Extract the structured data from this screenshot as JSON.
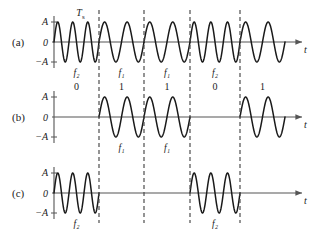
{
  "figure": {
    "title": "",
    "rows": [
      {
        "id": "a",
        "label": "(a)",
        "axis": {
          "top": "A",
          "mid": "0",
          "bottom": "−A",
          "x_axis": "t"
        },
        "annotation": "T",
        "annotation_sub": "s",
        "segment_labels": [
          "f₂",
          "f₁",
          "f₁",
          "f₂",
          ""
        ],
        "bit_labels": [
          "0",
          "1",
          "1",
          "0",
          "1"
        ]
      },
      {
        "id": "b",
        "label": "(b)",
        "axis": {
          "top": "A",
          "mid": "0",
          "bottom": "−A",
          "x_axis": "t"
        },
        "annotation": "",
        "annotation_sub": "",
        "segment_labels": [
          "",
          "f₁",
          "f₁",
          "",
          ""
        ],
        "bit_labels": []
      },
      {
        "id": "c",
        "label": "(c)",
        "axis": {
          "top": "A",
          "mid": "0",
          "bottom": "−A",
          "x_axis": "t"
        },
        "annotation": "",
        "annotation_sub": "",
        "segment_labels": [
          "f₂",
          "",
          "",
          "f₂",
          ""
        ],
        "bit_labels": []
      }
    ]
  },
  "chart_data": {
    "type": "line",
    "xlabel": "t",
    "ylabel": "A",
    "ylim": [
      -1,
      1
    ],
    "grid": false,
    "legend": "none",
    "bit_period_label": "T_s",
    "bits": [
      "0",
      "1",
      "1",
      "0",
      "1"
    ],
    "frequencies": {
      "f1": {
        "label": "f₁",
        "cycles_per_bit": 2
      },
      "f2": {
        "label": "f₂",
        "cycles_per_bit": 3
      }
    },
    "segment_boundaries_px": [
      54,
      99,
      144,
      190,
      240,
      285
    ],
    "series": [
      {
        "name": "(a) FSK signal s(t)",
        "row": "a",
        "segments": [
          {
            "index": 0,
            "bit": "0",
            "freq": "f2",
            "cycles": 3,
            "active": true
          },
          {
            "index": 1,
            "bit": "1",
            "freq": "f1",
            "cycles": 2,
            "active": true
          },
          {
            "index": 2,
            "bit": "1",
            "freq": "f1",
            "cycles": 2,
            "active": true
          },
          {
            "index": 3,
            "bit": "0",
            "freq": "f2",
            "cycles": 3,
            "active": true
          },
          {
            "index": 4,
            "bit": "1",
            "freq": "f1",
            "cycles": 2,
            "active": true
          }
        ]
      },
      {
        "name": "(b) f1 component",
        "row": "b",
        "segments": [
          {
            "index": 0,
            "bit": "0",
            "freq": "f1",
            "cycles": 2,
            "active": false
          },
          {
            "index": 1,
            "bit": "1",
            "freq": "f1",
            "cycles": 2,
            "active": true
          },
          {
            "index": 2,
            "bit": "1",
            "freq": "f1",
            "cycles": 2,
            "active": true
          },
          {
            "index": 3,
            "bit": "0",
            "freq": "f1",
            "cycles": 2,
            "active": false
          },
          {
            "index": 4,
            "bit": "1",
            "freq": "f1",
            "cycles": 2,
            "active": true
          }
        ]
      },
      {
        "name": "(c) f2 component",
        "row": "c",
        "segments": [
          {
            "index": 0,
            "bit": "0",
            "freq": "f2",
            "cycles": 3,
            "active": true
          },
          {
            "index": 1,
            "bit": "1",
            "freq": "f2",
            "cycles": 3,
            "active": false
          },
          {
            "index": 2,
            "bit": "1",
            "freq": "f2",
            "cycles": 3,
            "active": false
          },
          {
            "index": 3,
            "bit": "0",
            "freq": "f2",
            "cycles": 3,
            "active": true
          },
          {
            "index": 4,
            "bit": "1",
            "freq": "f2",
            "cycles": 3,
            "active": false
          }
        ]
      }
    ],
    "colors": {
      "wave": "#1a1a1a",
      "axis": "#555555",
      "dashed": "#4d4d4d",
      "text": "#1a1a1a"
    }
  }
}
